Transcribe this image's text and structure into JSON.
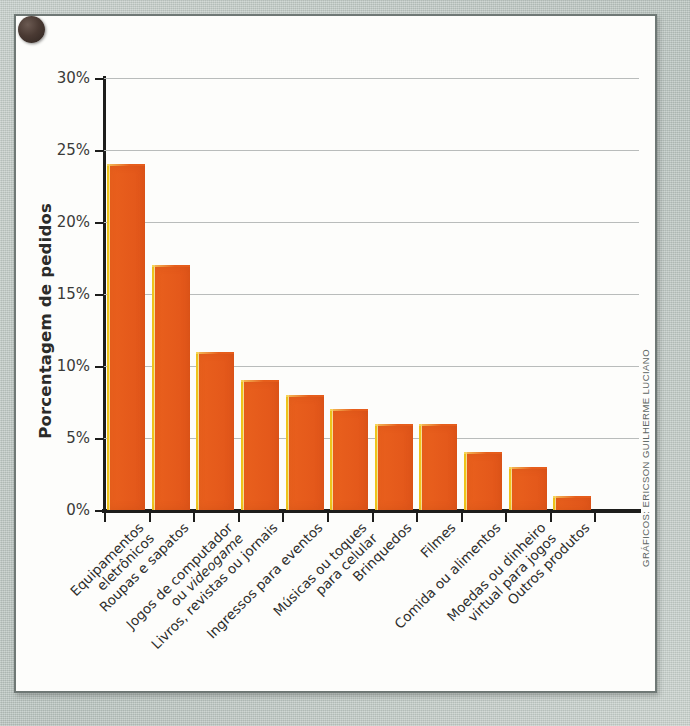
{
  "credit": "GRÁFICOS: ERICSON GUILHERME LUCIANO",
  "colors": {
    "bar_fill": "#E8601C",
    "bar_edge_highlight": "#F7D21E",
    "axis": "#1D1D1B",
    "gridline": "#B9BCBB",
    "card_bg": "#FDFDFB",
    "page_bg": "#B9C4BF"
  },
  "chart_data": {
    "type": "bar",
    "title": "",
    "xlabel": "",
    "ylabel": "Porcentagem de pedidos",
    "ylim": [
      0,
      30
    ],
    "yticks": [
      0,
      5,
      10,
      15,
      20,
      25,
      30
    ],
    "ytick_labels": [
      "0%",
      "5%",
      "10%",
      "15%",
      "20%",
      "25%",
      "30%"
    ],
    "grid": true,
    "legend": "none",
    "categories": [
      "Equipamentos eletrônicos",
      "Roupas e sapatos",
      "Jogos de computador ou videogame",
      "Livros, revistas ou jornais",
      "Ingressos para eventos",
      "Músicas ou toques para celular",
      "Brinquedos",
      "Filmes",
      "Comida ou alimentos",
      "Moedas ou dinheiro virtual para jogos",
      "Outros produtos"
    ],
    "category_lines": [
      [
        "Equipamentos",
        "eletrônicos"
      ],
      [
        "Roupas e sapatos"
      ],
      [
        "Jogos de computador",
        "ou videogame"
      ],
      [
        "Livros, revistas ou jornais"
      ],
      [
        "Ingressos para eventos"
      ],
      [
        "Músicas ou toques",
        "para celular"
      ],
      [
        "Brinquedos"
      ],
      [
        "Filmes"
      ],
      [
        "Comida ou alimentos"
      ],
      [
        "Moedas ou dinheiro",
        "virtual para jogos"
      ],
      [
        "Outros produtos"
      ]
    ],
    "italic_words": [
      "videogame"
    ],
    "values": [
      24,
      17,
      11,
      9,
      8,
      7,
      6,
      6,
      4,
      3,
      1
    ],
    "value_labels": [
      "24%",
      "17%",
      "11%",
      "9%",
      "8%",
      "7%",
      "6%",
      "6%",
      "4%",
      "3%",
      "1%"
    ]
  }
}
